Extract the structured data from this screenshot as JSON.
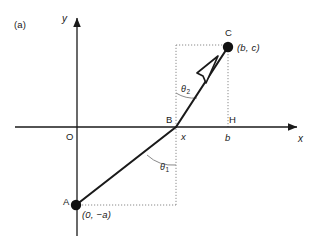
{
  "figure": {
    "panel_label": "(a)",
    "background_color": "#ffffff",
    "stroke_color": "#1a1a1a",
    "dotted_color": "#8a8a8a",
    "axes": {
      "y_label": "y",
      "x_label": "x",
      "origin_label": "O"
    },
    "points": [
      {
        "id": "A",
        "name": "point-a",
        "label": "A",
        "coord_label": "(0, −a)",
        "px": 76,
        "py": 205,
        "marker": "filled-dot"
      },
      {
        "id": "B",
        "name": "point-b",
        "label": "B",
        "coord_label": "x",
        "px": 176,
        "py": 127,
        "marker": "none"
      },
      {
        "id": "C",
        "name": "point-c",
        "label": "C",
        "coord_label": "(b, c)",
        "px": 228,
        "py": 47,
        "marker": "filled-dot"
      },
      {
        "id": "H",
        "name": "point-h",
        "label": "H",
        "coord_label": "b",
        "px": 228,
        "py": 127,
        "marker": "none"
      }
    ],
    "angles": [
      {
        "id": "theta1",
        "name": "angle-theta-1",
        "label": "θ",
        "subscript": "1",
        "vertex": "B",
        "description": "angle at B between segment BA and the downward vertical"
      },
      {
        "id": "theta2",
        "name": "angle-theta-2",
        "label": "θ",
        "subscript": "2",
        "vertex": "B",
        "description": "angle at B between segment BC and the upward vertical"
      }
    ],
    "segments": [
      {
        "name": "segment-a-to-b",
        "from": "A",
        "to": "B",
        "style": "solid"
      },
      {
        "name": "segment-b-to-c",
        "from": "B",
        "to": "C",
        "style": "solid-with-open-arrowhead"
      }
    ],
    "guides": [
      {
        "name": "guide-a-horizontal",
        "style": "dotted",
        "description": "horizontal dotted line from A to below B"
      },
      {
        "name": "guide-b-vertical",
        "style": "dotted",
        "description": "vertical dotted line through B from below A level up to C level"
      },
      {
        "name": "guide-c-horizontal",
        "style": "dotted",
        "description": "horizontal dotted line from above B to C"
      },
      {
        "name": "guide-h-vertical",
        "style": "dotted",
        "description": "vertical dotted line from C down to H on the x-axis"
      }
    ]
  }
}
